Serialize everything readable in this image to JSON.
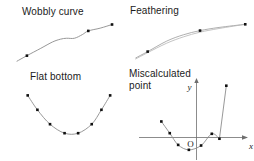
{
  "figure": {
    "width": 254,
    "height": 161,
    "background": "#ffffff",
    "curve_color": "#8c8c8c",
    "axis_color": "#6e6e6e",
    "marker_color": "#111111",
    "text_color": "#1b1b1b"
  },
  "panels": {
    "wobbly": {
      "title": "Wobbly curve",
      "axis_label_x": "",
      "axis_label_y": ""
    },
    "feathering": {
      "title": "Feathering"
    },
    "flat_bottom": {
      "title": "Flat bottom"
    },
    "miscalculated": {
      "title": "Miscalculated\npoint",
      "axis_label_x": "x",
      "axis_label_y": "y",
      "origin_label": "O"
    }
  },
  "chart_data": [
    {
      "type": "line",
      "title": "Wobbly curve",
      "xlabel": "",
      "ylabel": "",
      "grid": false,
      "legend": null,
      "xlim": [
        0,
        100
      ],
      "ylim": [
        0,
        48
      ],
      "annotation": "Interpolated curve oscillates (wobbles) between data points instead of following a smooth monotone path.",
      "points": [
        {
          "x": 10,
          "y": 8
        },
        {
          "x": 72,
          "y": 35
        },
        {
          "x": 96,
          "y": 42
        }
      ],
      "curve": [
        {
          "x": 0,
          "y": 2
        },
        {
          "x": 10,
          "y": 8
        },
        {
          "x": 24,
          "y": 16
        },
        {
          "x": 36,
          "y": 23
        },
        {
          "x": 44,
          "y": 26
        },
        {
          "x": 50,
          "y": 27
        },
        {
          "x": 58,
          "y": 27
        },
        {
          "x": 66,
          "y": 31
        },
        {
          "x": 72,
          "y": 35
        },
        {
          "x": 84,
          "y": 38
        },
        {
          "x": 96,
          "y": 42
        }
      ]
    },
    {
      "type": "line",
      "title": "Feathering",
      "xlabel": "",
      "ylabel": "",
      "grid": false,
      "legend": null,
      "xlim": [
        0,
        100
      ],
      "ylim": [
        0,
        40
      ],
      "annotation": "Two nearly coincident curves separate slightly in the middle, producing a feathered double line.",
      "points": [
        {
          "x": 14,
          "y": 8
        },
        {
          "x": 58,
          "y": 28
        },
        {
          "x": 96,
          "y": 34
        }
      ],
      "series": [
        {
          "name": "curve-a",
          "values": [
            {
              "x": 4,
              "y": 2
            },
            {
              "x": 14,
              "y": 8
            },
            {
              "x": 30,
              "y": 18
            },
            {
              "x": 44,
              "y": 24
            },
            {
              "x": 58,
              "y": 28
            },
            {
              "x": 74,
              "y": 31
            },
            {
              "x": 96,
              "y": 34
            }
          ]
        },
        {
          "name": "curve-b",
          "values": [
            {
              "x": 4,
              "y": 1
            },
            {
              "x": 14,
              "y": 7
            },
            {
              "x": 30,
              "y": 16
            },
            {
              "x": 44,
              "y": 22
            },
            {
              "x": 58,
              "y": 26.5
            },
            {
              "x": 74,
              "y": 30
            },
            {
              "x": 96,
              "y": 34
            }
          ]
        }
      ]
    },
    {
      "type": "line",
      "title": "Flat bottom",
      "xlabel": "",
      "ylabel": "",
      "grid": false,
      "legend": null,
      "xlim": [
        0,
        100
      ],
      "ylim": [
        0,
        60
      ],
      "annotation": "The fitted curve flattens across the two lowest samples instead of forming a rounded minimum.",
      "points": [
        {
          "x": 10,
          "y": 54
        },
        {
          "x": 20,
          "y": 38
        },
        {
          "x": 33,
          "y": 22
        },
        {
          "x": 48,
          "y": 12
        },
        {
          "x": 62,
          "y": 12
        },
        {
          "x": 76,
          "y": 22
        },
        {
          "x": 86,
          "y": 38
        },
        {
          "x": 95,
          "y": 54
        }
      ],
      "values": [
        54,
        38,
        22,
        12,
        12,
        22,
        38,
        54
      ]
    },
    {
      "type": "line",
      "title": "Miscalculated point",
      "xlabel": "x",
      "ylabel": "y",
      "grid": false,
      "legend": null,
      "xlim": [
        -7,
        7
      ],
      "ylim": [
        -3,
        9
      ],
      "origin_label": "O",
      "annotation": "One sample is computed incorrectly, so the curve spikes sharply away from the parabola near the right-hand root.",
      "points": [
        {
          "x": -4.6,
          "y": 2.6
        },
        {
          "x": -3.5,
          "y": 0.7
        },
        {
          "x": -2.4,
          "y": -1.2
        },
        {
          "x": -1.0,
          "y": -2.0
        },
        {
          "x": 0.6,
          "y": -1.3
        },
        {
          "x": 2.0,
          "y": 0.6
        },
        {
          "x": 3.0,
          "y": -0.2
        },
        {
          "x": 3.9,
          "y": 8.4
        }
      ],
      "outlier_index": 7
    }
  ]
}
